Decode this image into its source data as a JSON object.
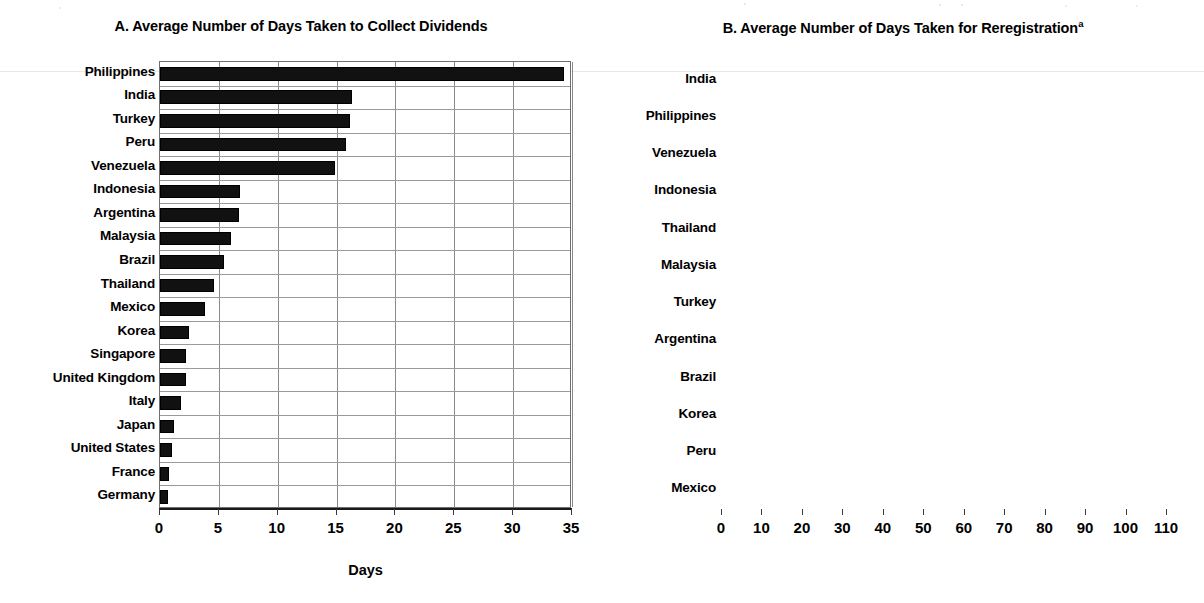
{
  "figure": {
    "days_axis_label_a": "Days",
    "days_axis_label_b": "Days"
  },
  "panel_a": {
    "title": "A. Average Number of Days Taken to Collect Dividends",
    "title_superscript": "",
    "axis_title": "Days",
    "tick_labels": [
      "0",
      "5",
      "10",
      "15",
      "20",
      "25",
      "30",
      "35"
    ],
    "categories": [
      "Philippines",
      "India",
      "Turkey",
      "Peru",
      "Venezuela",
      "Indonesia",
      "Argentina",
      "Malaysia",
      "Brazil",
      "Thailand",
      "Mexico",
      "Korea",
      "Singapore",
      "United Kingdom",
      "Italy",
      "Japan",
      "United States",
      "France",
      "Germany"
    ]
  },
  "panel_b": {
    "title": "B. Average Number of Days Taken for Reregistration",
    "title_superscript": "a",
    "axis_title": "Days",
    "tick_labels": [
      "0",
      "10",
      "20",
      "30",
      "40",
      "50",
      "60",
      "70",
      "80",
      "90",
      "100",
      "110"
    ],
    "categories": [
      "India",
      "Philippines",
      "Venezuela",
      "Indonesia",
      "Thailand",
      "Malaysia",
      "Turkey",
      "Argentina",
      "Brazil",
      "Korea",
      "Peru",
      "Mexico"
    ]
  },
  "chart_data": [
    {
      "type": "bar",
      "orientation": "horizontal",
      "panel": "A",
      "title": "A. Average Number of Days Taken to Collect Dividends",
      "xlabel": "Days",
      "ylabel": "",
      "xlim": [
        0,
        35
      ],
      "xticks": [
        0,
        5,
        10,
        15,
        20,
        25,
        30,
        35
      ],
      "grid": "vertical-and-horizontal",
      "legend": "none",
      "bar_color": "#111111",
      "categories": [
        "Philippines",
        "India",
        "Turkey",
        "Peru",
        "Venezuela",
        "Indonesia",
        "Argentina",
        "Malaysia",
        "Brazil",
        "Thailand",
        "Mexico",
        "Korea",
        "Singapore",
        "United Kingdom",
        "Italy",
        "Japan",
        "United States",
        "France",
        "Germany"
      ],
      "values": [
        34.3,
        16.3,
        16.1,
        15.8,
        14.9,
        6.8,
        6.7,
        6.0,
        5.4,
        4.6,
        3.8,
        2.5,
        2.2,
        2.2,
        1.8,
        1.2,
        1.0,
        0.8,
        0.7
      ]
    },
    {
      "type": "bar",
      "orientation": "horizontal",
      "panel": "B",
      "title": "B. Average Number of Days Taken for Reregistration",
      "title_footnote_marker": "a",
      "xlabel": "Days",
      "ylabel": "",
      "xlim": [
        0,
        110
      ],
      "xticks": [
        0,
        10,
        20,
        30,
        40,
        50,
        60,
        70,
        80,
        90,
        100,
        110
      ],
      "grid": "vertical-and-horizontal",
      "legend": "none",
      "bar_color": "#111111",
      "categories": [
        "India",
        "Philippines",
        "Venezuela",
        "Indonesia",
        "Thailand",
        "Malaysia",
        "Turkey",
        "Argentina",
        "Brazil",
        "Korea",
        "Peru",
        "Mexico"
      ],
      "values": [
        101.0,
        50.5,
        21.8,
        19.5,
        16.5,
        15.5,
        11.5,
        1.6,
        0.7,
        0.4,
        0.4,
        0.0
      ]
    }
  ]
}
